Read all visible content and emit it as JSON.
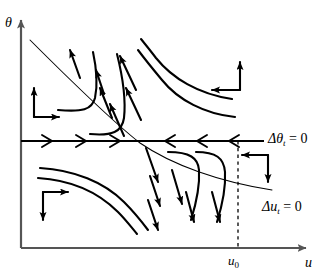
{
  "figure": {
    "type": "phase-portrait",
    "title": "",
    "background_color": "#ffffff",
    "stroke_color": "#000000",
    "axis_color": "#555555",
    "width": 326,
    "height": 277
  },
  "axes": {
    "vertical": {
      "name": "theta-axis",
      "label": "θ",
      "x": 21,
      "y_top": 14,
      "y_bottom": 248,
      "arrowhead": "up"
    },
    "horizontal": {
      "name": "u-axis",
      "label": "u",
      "y": 248,
      "x_left": 21,
      "x_right": 312,
      "arrowhead": "right"
    },
    "ticks": [
      {
        "name": "u0-tick",
        "label": "u₀",
        "axis": "horizontal",
        "x": 238
      }
    ]
  },
  "nullclines": [
    {
      "name": "delta-theta-nullcline",
      "label": "Δθ",
      "subscript": "t",
      "equals": "= 0",
      "full_label": "Δθₜ = 0",
      "orientation": "horizontal",
      "y": 141,
      "x_start": 21,
      "x_end": 264,
      "flow_arrows": {
        "left_of_saddle": {
          "direction": "right",
          "count": 3,
          "x_positions": [
            46,
            78,
            110
          ]
        },
        "right_of_saddle": {
          "direction": "left",
          "count": 3,
          "x_positions": [
            167,
            199,
            231
          ]
        }
      }
    },
    {
      "name": "delta-u-nullcline",
      "label": "Δu",
      "subscript": "t",
      "equals": "= 0",
      "full_label": "Δuₜ = 0",
      "orientation": "diagonal",
      "points": [
        [
          30,
          40
        ],
        [
          140,
          143
        ],
        [
          200,
          172
        ],
        [
          270,
          189
        ]
      ]
    }
  ],
  "dashed_guide": {
    "name": "u0-dashed-line",
    "x": 238,
    "y_top": 141,
    "y_bottom": 248,
    "style": "dashed"
  },
  "saddle_point": {
    "name": "saddle-equilibrium",
    "x": 140,
    "y": 141
  },
  "direction_field_clusters": [
    {
      "name": "direction-cluster-upper-left",
      "quadrant": "upper-left",
      "corner_x": 34,
      "corner_y": 117,
      "arrows": [
        "up",
        "right"
      ]
    },
    {
      "name": "direction-cluster-upper-right",
      "quadrant": "upper-right",
      "corner_x": 240,
      "corner_y": 90,
      "arrows": [
        "up",
        "left"
      ]
    },
    {
      "name": "direction-cluster-lower-left",
      "quadrant": "lower-left",
      "corner_x": 43,
      "corner_y": 192,
      "arrows": [
        "right",
        "down"
      ]
    },
    {
      "name": "direction-cluster-lower-right",
      "quadrant": "lower-right",
      "corner_x": 268,
      "corner_y": 155,
      "arrows": [
        "left",
        "down"
      ]
    }
  ],
  "trajectories": {
    "upper_converging": {
      "note": "curves in upper region flowing up-left toward stable arm",
      "count": 5
    },
    "lower_diverging": {
      "note": "curves in lower region flowing down-right away from saddle",
      "count": 5
    },
    "arrow_direction_upper": "up-left",
    "arrow_direction_lower": "down-right"
  }
}
